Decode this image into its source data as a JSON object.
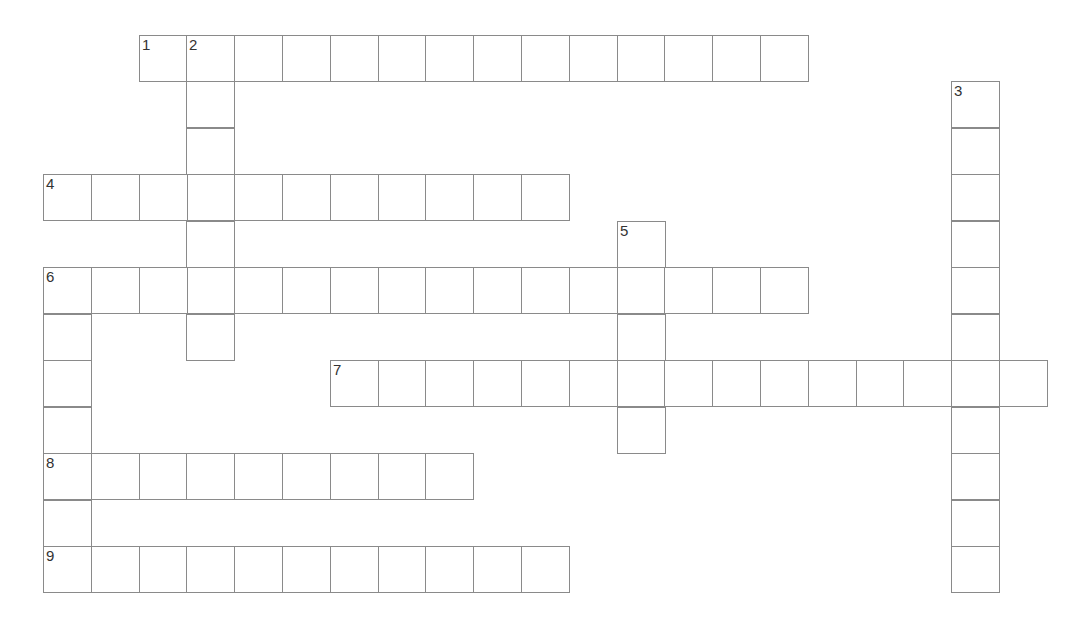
{
  "puzzle": {
    "type": "crossword",
    "grid_origin": {
      "x": 43,
      "y": 35
    },
    "cell_size": {
      "w": 47.8,
      "h": 46.45
    },
    "border_color": "#8a8a8a",
    "entries": [
      {
        "number": "1",
        "direction": "across",
        "row": 0,
        "col": 2,
        "length": 14
      },
      {
        "number": "2",
        "direction": "down",
        "row": 0,
        "col": 3,
        "length": 7
      },
      {
        "number": "3",
        "direction": "down",
        "row": 1,
        "col": 19,
        "length": 11
      },
      {
        "number": "4",
        "direction": "across",
        "row": 3,
        "col": 0,
        "length": 11
      },
      {
        "number": "5",
        "direction": "down",
        "row": 4,
        "col": 12,
        "length": 5
      },
      {
        "number": "6",
        "direction": "across",
        "row": 5,
        "col": 0,
        "length": 16
      },
      {
        "number": "6",
        "direction": "down",
        "row": 5,
        "col": 0,
        "length": 7
      },
      {
        "number": "7",
        "direction": "across",
        "row": 7,
        "col": 6,
        "length": 15
      },
      {
        "number": "8",
        "direction": "across",
        "row": 9,
        "col": 0,
        "length": 9
      },
      {
        "number": "9",
        "direction": "across",
        "row": 11,
        "col": 0,
        "length": 11
      }
    ]
  }
}
